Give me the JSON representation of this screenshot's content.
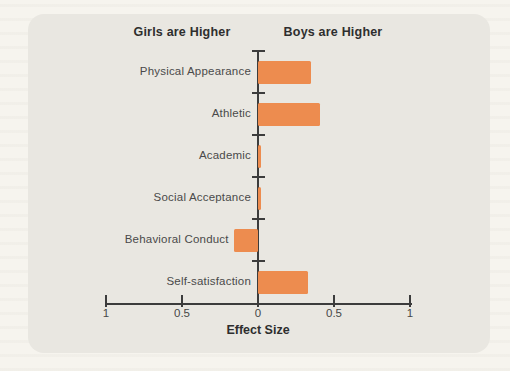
{
  "page": {
    "background": "#f6f4ee"
  },
  "panel": {
    "background": "#e9e7e1",
    "corner_radius_px": 16
  },
  "chart_data": {
    "type": "bar",
    "orientation": "horizontal",
    "left_header": "Girls are Higher",
    "right_header": "Boys are Higher",
    "xlabel": "Effect Size",
    "categories": [
      "Physical Appearance",
      "Athletic",
      "Academic",
      "Social Acceptance",
      "Behavioral Conduct",
      "Self-satisfaction"
    ],
    "values": [
      0.35,
      0.41,
      0.02,
      0.02,
      -0.16,
      0.33
    ],
    "xlim": [
      -1,
      1
    ],
    "x_axis": {
      "tick_values": [
        -1,
        -0.5,
        0,
        0.5,
        1
      ],
      "tick_labels": [
        "1",
        "0.5",
        "0",
        "0.5",
        "1"
      ]
    },
    "grid": "off",
    "legend": "none",
    "bar_color": "#ed8c4f",
    "axis_color": "#3c3c3c",
    "label_color": "#4a4a4a"
  }
}
